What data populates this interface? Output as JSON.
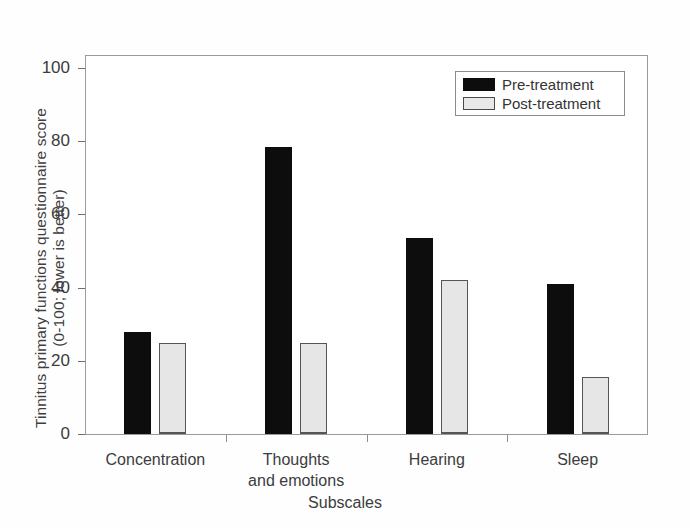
{
  "chart_data": {
    "type": "bar",
    "title": "",
    "xlabel": "Subscales",
    "ylabel_line1": "Tinnitus primary functions questionnaire score",
    "ylabel_line2": "(0-100; lower is better)",
    "categories": [
      "Concentration",
      "Thoughts and emotions",
      "Hearing",
      "Sleep"
    ],
    "category_lines": [
      [
        "Concentration"
      ],
      [
        "Thoughts",
        "and emotions"
      ],
      [
        "Hearing"
      ],
      [
        "Sleep"
      ]
    ],
    "series": [
      {
        "name": "Pre-treatment",
        "color": "#0d0d0d",
        "values": [
          28,
          78.5,
          53.5,
          41
        ]
      },
      {
        "name": "Post-treatment",
        "color": "#e6e6e6",
        "values": [
          25,
          25,
          42,
          15.5
        ]
      }
    ],
    "ylim": [
      0,
      100
    ],
    "yticks": [
      0,
      20,
      40,
      60,
      80,
      100
    ],
    "ytick_labels": [
      "0",
      "20",
      "40",
      "60",
      "80",
      "100"
    ],
    "grid": false,
    "legend_position": "top-right",
    "frame": true
  },
  "legend": {
    "items": [
      {
        "label": "Pre-treatment",
        "style": "pre"
      },
      {
        "label": "Post-treatment",
        "style": "post"
      }
    ]
  }
}
